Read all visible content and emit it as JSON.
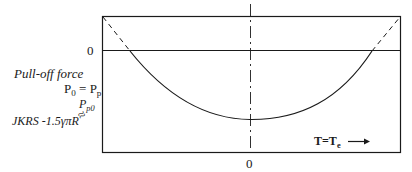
{
  "diagram": {
    "type": "pull-off force vs temperature curve",
    "y_axis": {
      "zero_label": "0",
      "title": "Pull-off force",
      "equation": {
        "lhs": "P",
        "lhs_sub": "0",
        "eq": "=",
        "rhs": "P",
        "rhs_sub": "p"
      },
      "min_label": {
        "symbol": "P",
        "sub": "p0"
      },
      "approx_symbol": "≈",
      "jkrs_label": "JKRS -1.5γπR"
    },
    "x_axis": {
      "zero_label": "0",
      "title": {
        "lhs": "T",
        "eq": "=",
        "rhs": "T",
        "rhs_sub": "e"
      },
      "arrow": "→"
    },
    "colors": {
      "line": "#1a1a1a",
      "background": "#ffffff"
    }
  }
}
